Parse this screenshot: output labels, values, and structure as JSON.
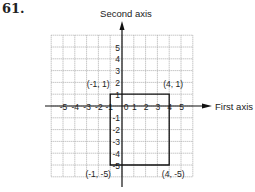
{
  "problem_number": "61.",
  "chart_data": {
    "type": "scatter",
    "title": "",
    "xlabel": "First axis",
    "ylabel": "Second axis",
    "xlim": [
      -6,
      6
    ],
    "ylim": [
      -6,
      6
    ],
    "grid": true,
    "x_tick_labels": [
      "-5",
      "-4",
      "-3",
      "-2",
      "-1",
      "0",
      "1",
      "2",
      "3",
      "4",
      "5"
    ],
    "y_tick_labels": [
      "5",
      "4",
      "3",
      "2",
      "1",
      "-1",
      "-2",
      "-3",
      "-4",
      "-5"
    ],
    "shape": "rectangle",
    "points": [
      {
        "x": -1,
        "y": 1,
        "label": "(-1, 1)"
      },
      {
        "x": 4,
        "y": 1,
        "label": "(4, 1)"
      },
      {
        "x": 4,
        "y": -5,
        "label": "(4, -5)"
      },
      {
        "x": -1,
        "y": -5,
        "label": "(-1, -5)"
      }
    ]
  }
}
